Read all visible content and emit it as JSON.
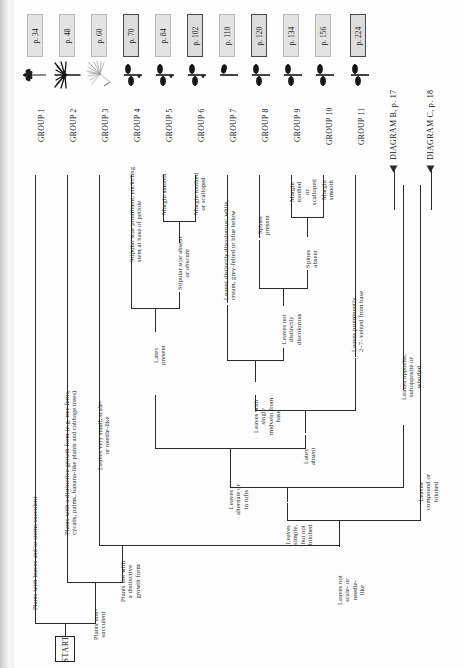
{
  "diagram": {
    "start_label": "START",
    "orientation": "rotated-90"
  },
  "groups": [
    {
      "name": "GROUP 1",
      "page": "p. 34",
      "icon": "succulent-rosette-icon",
      "highlight": false
    },
    {
      "name": "GROUP 2",
      "page": "p. 48",
      "icon": "palm-frond-icon",
      "highlight": false
    },
    {
      "name": "GROUP 3",
      "page": "p. 60",
      "icon": "grass-tuft-icon",
      "highlight": false
    },
    {
      "name": "GROUP 4",
      "page": "p. 70",
      "icon": "opposite-leaves-icon",
      "highlight": true
    },
    {
      "name": "GROUP 5",
      "page": "p. 84",
      "icon": "opposite-leaves-icon",
      "highlight": false
    },
    {
      "name": "GROUP 6",
      "page": "p. 102",
      "icon": "opposite-leaves-icon",
      "highlight": true
    },
    {
      "name": "GROUP 7",
      "page": "p. 110",
      "icon": "alternate-leaves-icon",
      "highlight": false
    },
    {
      "name": "GROUP 8",
      "page": "p. 120",
      "icon": "opposite-leaves-icon",
      "highlight": true
    },
    {
      "name": "GROUP 9",
      "page": "p. 134",
      "icon": "opposite-leaves-icon",
      "highlight": false
    },
    {
      "name": "GROUP 10",
      "page": "p. 156",
      "icon": "opposite-leaves-icon",
      "highlight": false
    },
    {
      "name": "GROUP 11",
      "page": "p. 224",
      "icon": "opposite-leaves-icon",
      "highlight": true
    }
  ],
  "diagram_links": [
    {
      "label": "DIAGRAM B, p. 17"
    },
    {
      "label": "DIAGRAM C, p. 18"
    }
  ],
  "branches": {
    "succulent": "Plants with leaves and/or stems succulent",
    "non_succulent": "Plants non-\nsucculent",
    "distinctive_growth": "Plants with a distinctive growth form (e.g. tree ferns,\ncycads, palms, banana-like plants and cabbage trees)",
    "not_distinctive_growth": "Plants not with\na distinctive\ngrowth form",
    "leaves_scale_needle": "Leaves very small, scale-\nor needle-like",
    "leaves_not_scale_needle": "Leaves not\nscale- or\nneedle-\nlike",
    "leaves_simple_not_bilobed": "Leaves\nsimple,\nbut not\nbilobed",
    "leaves_compound_or_bilobed": "Leaves\ncompound or\nbilobed",
    "leaves_alternate_tufts": "Leaves\nalternate or\nin tufts",
    "leaves_opposite_whorled": "Leaves opposite,\nsubopposite or\nwhorled",
    "latex_present": "Latex\npresent",
    "latex_absent": "Latex\nabsent",
    "stipular_scar_present": "Stipular scar prominent, encircling\nstem at base of petiole",
    "stipular_scar_absent": "Stipular scar absent\nor obscure",
    "margin_smooth_1": "Margin smooth",
    "margin_toothed_1": "Margin toothed\nor scalloped",
    "leaves_single_midvein": "Leaves with\nsingle\nmidvein from\nbase",
    "leaves_prominently_veined": "Leaves prominently\n2–7- veined from base",
    "leaves_discolorous": "Leaves distinctly discolorous: white,\ncream, grey-felted or blue below",
    "leaves_not_discolorous": "Leaves not\ndistinctly\ndiscolorous",
    "spines_present": "Spines\npresent",
    "spines_absent": "Spines\nabsent",
    "margin_toothed_2": "Margin\ntoothed\nor\nscalloped",
    "margin_smooth_2": "Margin\nsmooth"
  },
  "colors": {
    "line": "#2a2a2a",
    "box_fill": "#e3e3e3",
    "box_border": "#b9b9b9",
    "box_border_strong": "#4a4a4a",
    "page_bg": "#fdfdfd"
  }
}
